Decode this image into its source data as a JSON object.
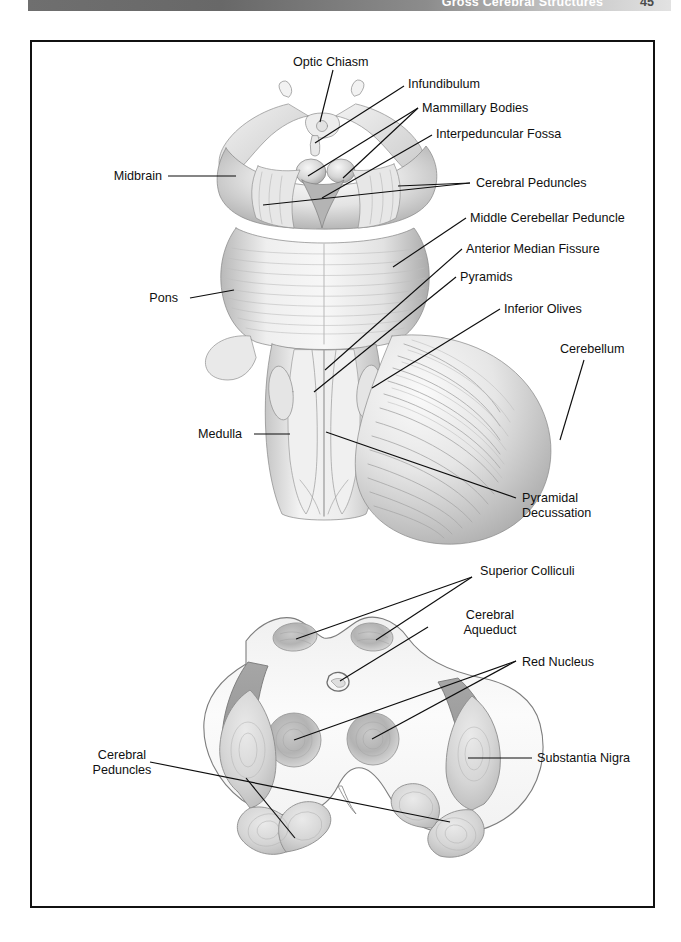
{
  "header": {
    "title": "Gross Cerebral Structures",
    "page_number": "45"
  },
  "figure_top": {
    "name": "brainstem-ventral-view",
    "labels": [
      {
        "id": "optic-chiasm",
        "text": "Optic Chiasm"
      },
      {
        "id": "infundibulum",
        "text": "Infundibulum"
      },
      {
        "id": "mammillary-bodies",
        "text": "Mammillary Bodies"
      },
      {
        "id": "interpeduncular-fossa",
        "text": "Interpeduncular Fossa"
      },
      {
        "id": "midbrain",
        "text": "Midbrain"
      },
      {
        "id": "cerebral-peduncles",
        "text": "Cerebral Peduncles"
      },
      {
        "id": "middle-cerebellar-peduncle",
        "text": "Middle Cerebellar Peduncle"
      },
      {
        "id": "anterior-median-fissure",
        "text": "Anterior Median Fissure"
      },
      {
        "id": "pyramids",
        "text": "Pyramids"
      },
      {
        "id": "inferior-olives",
        "text": "Inferior Olives"
      },
      {
        "id": "pons",
        "text": "Pons"
      },
      {
        "id": "cerebellum",
        "text": "Cerebellum"
      },
      {
        "id": "medulla",
        "text": "Medulla"
      },
      {
        "id": "pyramidal-decussation",
        "text": "Pyramidal\nDecussation"
      }
    ]
  },
  "figure_bottom": {
    "name": "midbrain-cross-section",
    "labels": [
      {
        "id": "superior-colliculi",
        "text": "Superior Colliculi"
      },
      {
        "id": "cerebral-aqueduct",
        "text": "Cerebral\nAqueduct"
      },
      {
        "id": "red-nucleus",
        "text": "Red Nucleus"
      },
      {
        "id": "cerebral-peduncles-2",
        "text": "Cerebral\nPeduncles"
      },
      {
        "id": "substantia-nigra",
        "text": "Substantia Nigra"
      }
    ]
  },
  "colors": {
    "ink": "#101010",
    "frame": "#111111",
    "header_band_dark": "#6f6f6f",
    "header_band_light": "#e2e2e2",
    "pencil_light": "#e9e9e9",
    "pencil_mid": "#c4c4c4",
    "pencil_dark": "#9a9a9a"
  }
}
